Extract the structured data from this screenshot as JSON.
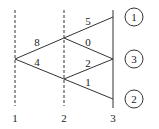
{
  "diagram": {
    "type": "trellis",
    "stage_labels": [
      "1",
      "2",
      "3"
    ],
    "stages": [
      {
        "label": "1",
        "x": 15,
        "style": "dashed"
      },
      {
        "label": "2",
        "x": 64,
        "style": "dashed"
      },
      {
        "label": "3",
        "x": 113,
        "style": "solid"
      }
    ],
    "nodes": [
      {
        "id": "s1",
        "x": 15,
        "y": 59
      },
      {
        "id": "s2a",
        "x": 64,
        "y": 38
      },
      {
        "id": "s2b",
        "x": 64,
        "y": 79
      },
      {
        "id": "s3a",
        "x": 113,
        "y": 17
      },
      {
        "id": "s3b",
        "x": 113,
        "y": 59
      },
      {
        "id": "s3c",
        "x": 113,
        "y": 99
      }
    ],
    "edges": [
      {
        "from": "s1",
        "to": "s2a",
        "weight": "8",
        "lx": 35,
        "ly": 44
      },
      {
        "from": "s1",
        "to": "s2b",
        "weight": "4",
        "lx": 35,
        "ly": 64
      },
      {
        "from": "s2a",
        "to": "s3a",
        "weight": "5",
        "lx": 86,
        "ly": 24
      },
      {
        "from": "s2a",
        "to": "s3b",
        "weight": "0",
        "lx": 86,
        "ly": 45
      },
      {
        "from": "s2b",
        "to": "s3b",
        "weight": "2",
        "lx": 86,
        "ly": 67
      },
      {
        "from": "s2b",
        "to": "s3c",
        "weight": "1",
        "lx": 86,
        "ly": 85
      }
    ],
    "outcomes": [
      {
        "label": "1",
        "cx": 134,
        "cy": 17
      },
      {
        "label": "3",
        "cx": 134,
        "cy": 59
      },
      {
        "label": "2",
        "cx": 134,
        "cy": 99
      }
    ]
  }
}
